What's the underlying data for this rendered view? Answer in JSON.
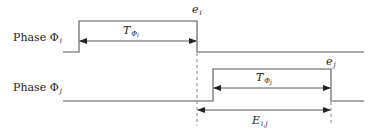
{
  "diagram": {
    "type": "timing-diagram",
    "phases": [
      {
        "id": "phase_i",
        "label_prefix": "Phase ",
        "symbol": "Φ",
        "subscript": "i",
        "low_y": 52,
        "high_y": 21,
        "start_x": 63,
        "rise_x": 79,
        "fall_x": 197,
        "end_x": 364,
        "duration_label": {
          "symbol": "T",
          "sub": "Φ",
          "subsub": "i"
        },
        "end_label": {
          "symbol": "e",
          "sub": "i"
        }
      },
      {
        "id": "phase_j",
        "label_prefix": "Phase ",
        "symbol": "Φ",
        "subscript": "j",
        "low_y": 101,
        "high_y": 69,
        "start_x": 63,
        "rise_x": 213,
        "fall_x": 331,
        "end_x": 364,
        "duration_label": {
          "symbol": "T",
          "sub": "Φ",
          "subsub": "j"
        },
        "end_label": {
          "symbol": "e",
          "sub": "j"
        }
      }
    ],
    "interval": {
      "symbol": "E",
      "sub": "i,j",
      "from_x": 197,
      "to_x": 331,
      "y": 110
    },
    "colors": {
      "line": "#555555",
      "text": "#222222",
      "dashed": "#777777"
    }
  }
}
